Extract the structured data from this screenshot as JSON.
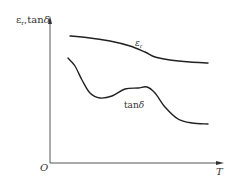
{
  "chart_data": {
    "type": "line",
    "title": "",
    "xlabel": "T",
    "ylabel": "εr, tanδ",
    "origin_label": "O",
    "grid": false,
    "legend": "inline curve labels",
    "axis_ticks": "none (qualitative schematic)",
    "series": [
      {
        "name": "εr",
        "label": "εr",
        "description": "gently decreasing, then flattening at high T",
        "points_px": [
          [
            70,
            36
          ],
          [
            90,
            38
          ],
          [
            110,
            41
          ],
          [
            130,
            46
          ],
          [
            145,
            52
          ],
          [
            155,
            57
          ],
          [
            170,
            60
          ],
          [
            190,
            62
          ],
          [
            208,
            63
          ]
        ]
      },
      {
        "name": "tanδ",
        "label": "tanδ",
        "description": "falls to a minimum, rises to a small hump, then falls and levels off",
        "points_px": [
          [
            68,
            58
          ],
          [
            75,
            66
          ],
          [
            82,
            80
          ],
          [
            90,
            93
          ],
          [
            100,
            98
          ],
          [
            112,
            96
          ],
          [
            125,
            89
          ],
          [
            138,
            88
          ],
          [
            147,
            87
          ],
          [
            155,
            93
          ],
          [
            165,
            107
          ],
          [
            178,
            119
          ],
          [
            192,
            123
          ],
          [
            208,
            124
          ]
        ]
      }
    ]
  },
  "axes": {
    "y_label_main": "ε",
    "y_label_sub": "r",
    "y_label_sep": ",",
    "y_label_tan": "tan",
    "y_label_delta": "δ",
    "x_label": "T",
    "origin": "O"
  },
  "labels": {
    "er_main": "ε",
    "er_sub": "r",
    "tan_text": "tan",
    "tan_delta": "δ"
  },
  "colors": {
    "curve": "#222222",
    "axis": "#444444"
  }
}
